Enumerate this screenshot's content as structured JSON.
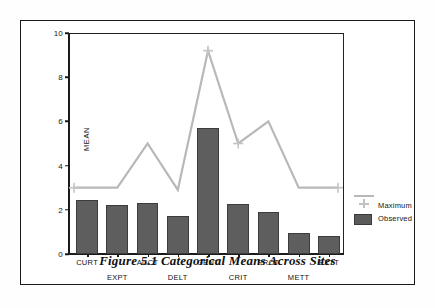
{
  "figure": {
    "caption": "Figure 5.1   Categorical Means Across Sites"
  },
  "legend": {
    "position": "right",
    "entries": [
      {
        "label": "Maximum",
        "type": "line",
        "color": "#b8b8b8"
      },
      {
        "label": "Observed",
        "type": "bar",
        "color": "#5a5a5a"
      }
    ]
  },
  "chart_data": {
    "type": "bar",
    "title": "",
    "subtitle": "",
    "xlabel": "",
    "ylabel": "MEAN",
    "ylim": [
      0,
      10
    ],
    "yticks": [
      0,
      2,
      4,
      6,
      8,
      10
    ],
    "ytick_labels": [
      "0",
      "2",
      "4",
      "6",
      "8",
      "10"
    ],
    "grid": false,
    "categories": [
      "CURT",
      "EXPT",
      "ACCT",
      "DELT",
      "GENT",
      "CRIT",
      "PROT",
      "METT",
      "EXTT"
    ],
    "series": [
      {
        "name": "Observed",
        "type": "bar",
        "color": "#5e5e5e",
        "values": [
          2.45,
          2.2,
          2.3,
          1.7,
          5.7,
          2.25,
          1.9,
          0.95,
          0.8
        ]
      },
      {
        "name": "Maximum",
        "type": "line",
        "color": "#b8b8b8",
        "values": [
          3.0,
          3.0,
          5.0,
          2.9,
          9.2,
          5.0,
          6.0,
          3.0,
          3.0
        ]
      }
    ]
  }
}
